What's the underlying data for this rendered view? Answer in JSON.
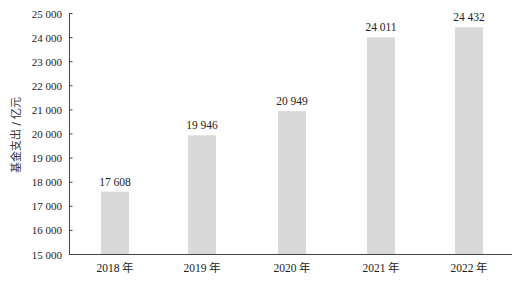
{
  "chart_data": {
    "type": "bar",
    "title": "",
    "xlabel": "",
    "ylabel": "基金支出 / 亿元",
    "categories": [
      "2018 年",
      "2019 年",
      "2020 年",
      "2021 年",
      "2022 年"
    ],
    "values": [
      17608,
      19946,
      20949,
      24011,
      24432
    ],
    "value_labels": [
      "17 608",
      "19 946",
      "20 949",
      "24 011",
      "24 432"
    ],
    "ylim": [
      15000,
      25000
    ],
    "yticks": [
      15000,
      16000,
      17000,
      18000,
      19000,
      20000,
      21000,
      22000,
      23000,
      24000,
      25000
    ],
    "ytick_labels": [
      "15 000",
      "16 000",
      "17 000",
      "18 000",
      "19 000",
      "20 000",
      "21 000",
      "22 000",
      "23 000",
      "24 000",
      "25 000"
    ],
    "grid": false,
    "legend": null,
    "bar_color": "#d9d9d9"
  }
}
